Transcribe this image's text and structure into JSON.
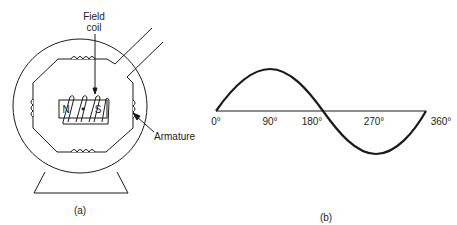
{
  "figure_a": {
    "caption": "(a)",
    "labels": {
      "field_coil_line1": "Field",
      "field_coil_line2": "coil",
      "armature": "Armature",
      "north_pole": "N",
      "south_pole": "S"
    }
  },
  "figure_b": {
    "caption": "(b)",
    "axis_ticks": [
      "0°",
      "90°",
      "180°",
      "270°",
      "360°"
    ]
  },
  "colors": {
    "stroke": "#1a1a1a",
    "background": "#ffffff"
  }
}
